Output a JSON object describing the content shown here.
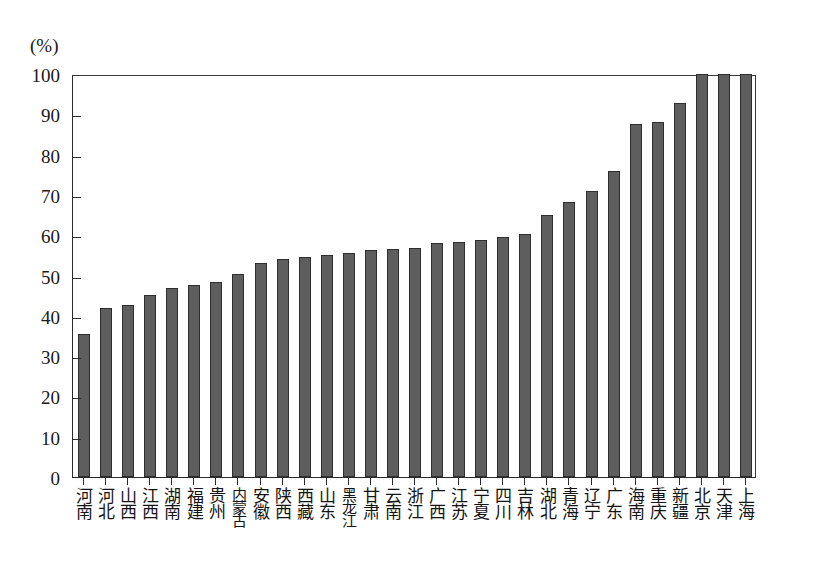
{
  "chart_data": {
    "type": "bar",
    "title": "",
    "subtitle": "",
    "unit_label": "(%)",
    "xlabel": "",
    "ylabel": "",
    "ylim": [
      0,
      100
    ],
    "y_ticks": [
      0,
      10,
      20,
      30,
      40,
      50,
      60,
      70,
      80,
      90,
      100
    ],
    "grid": false,
    "legend": null,
    "bar_color": "#5e5e5e",
    "bar_border_color": "#2e2e2e",
    "axis_color": "#2b2b2b",
    "categories": [
      "河南",
      "河北",
      "山西",
      "江西",
      "湖南",
      "福建",
      "贵州",
      "内蒙古",
      "安徽",
      "陕西",
      "西藏",
      "山东",
      "黑龙江",
      "甘肃",
      "云南",
      "浙江",
      "广西",
      "江苏",
      "宁夏",
      "四川",
      "吉林",
      "湖北",
      "青海",
      "辽宁",
      "广东",
      "海南",
      "重庆",
      "新疆",
      "北京",
      "天津",
      "上海"
    ],
    "values": [
      35.5,
      42.0,
      42.8,
      45.2,
      47.0,
      47.6,
      48.4,
      50.4,
      53.2,
      54.0,
      54.5,
      55.2,
      55.5,
      56.4,
      56.6,
      56.8,
      58.0,
      58.4,
      58.9,
      59.5,
      60.2,
      65.0,
      68.2,
      71.0,
      76.0,
      87.5,
      88.0,
      92.8,
      100.0,
      100.0,
      100.0
    ]
  }
}
